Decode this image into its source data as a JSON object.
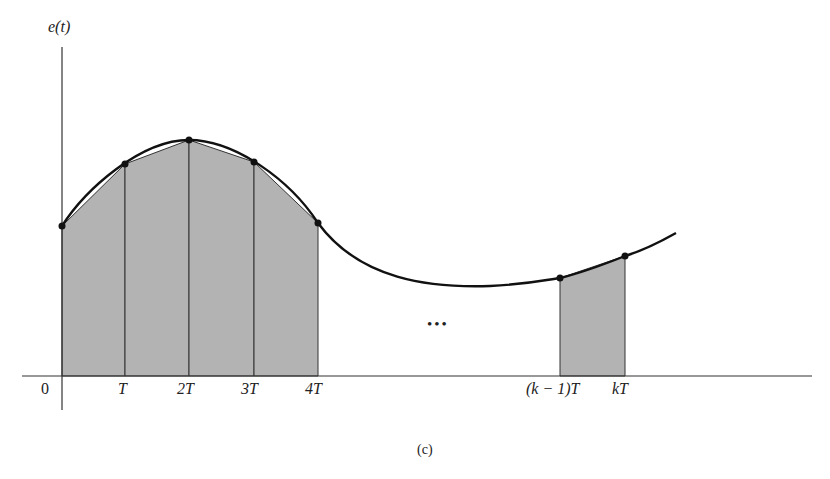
{
  "diagram": {
    "y_axis_label": "e(t)",
    "x_tick_labels": [
      "0",
      "T",
      "2T",
      "3T",
      "4T",
      "(k − 1)T",
      "kT"
    ],
    "ellipsis": "•••",
    "caption": "(c)",
    "colors": {
      "curve": "#111111",
      "axis": "#333333",
      "trapezoid_fill": "#b3b3b3",
      "point": "#111111"
    },
    "sample_points": [
      {
        "label": "0",
        "x": 62,
        "y": 226
      },
      {
        "label": "T",
        "x": 125,
        "y": 164
      },
      {
        "label": "2T",
        "x": 189,
        "y": 140
      },
      {
        "label": "3T",
        "x": 254,
        "y": 162
      },
      {
        "label": "4T",
        "x": 318,
        "y": 223
      },
      {
        "label": "(k-1)T",
        "x": 560,
        "y": 278
      },
      {
        "label": "kT",
        "x": 625,
        "y": 256
      }
    ]
  }
}
